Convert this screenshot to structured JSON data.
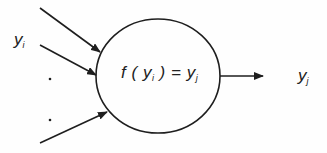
{
  "diagram": {
    "type": "neuron-node",
    "input_label": {
      "base": "y",
      "sub": "i"
    },
    "ellipsis": ".",
    "node_function": {
      "f": "f",
      "open": "(",
      "arg_base": "y",
      "arg_sub": "i",
      "close": ")",
      "eq": "=",
      "out_base": "y",
      "out_sub": "j"
    },
    "output_label": {
      "base": "y",
      "sub": "j"
    },
    "inputs_count": 3,
    "stroke_color": "#1e1e1e"
  }
}
